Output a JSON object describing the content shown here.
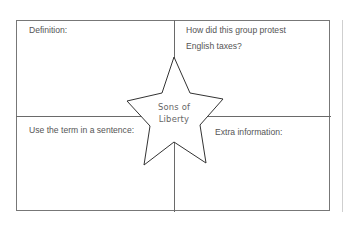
{
  "organizer": {
    "center_term_line1": "Sons of",
    "center_term_line2": "Liberty",
    "quadrants": {
      "top_left": "Definition:",
      "top_right": "How did this group protest English taxes?",
      "bottom_left": "Use the term in a sentence:",
      "bottom_right": "Extra information:"
    },
    "colors": {
      "border": "#777777",
      "text": "#555555",
      "star_stroke": "#333333"
    }
  }
}
